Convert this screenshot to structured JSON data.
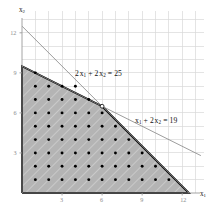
{
  "chart_data": {
    "type": "scatter",
    "title": "",
    "xlabel": "x₁",
    "ylabel": "x₂",
    "xlim": [
      0,
      13.6
    ],
    "ylim": [
      0,
      13.6
    ],
    "grid": true,
    "legend": "none",
    "xticks": [
      3,
      6,
      9,
      12
    ],
    "yticks": [
      3,
      6,
      9,
      12
    ],
    "xtick_labels": [
      "3",
      "6",
      "9",
      "12"
    ],
    "ytick_labels": [
      "3",
      "6",
      "9",
      "12"
    ],
    "annotations": [
      {
        "name": "constraint-label-2x1-2x2",
        "text_plain": "2 x₁ + 2 x₂ = 25",
        "x": 4.2,
        "y": 8.4
      },
      {
        "name": "constraint-label-x1-2x2",
        "text_plain": "x₁ + 2 x₂ = 19",
        "x": 8.6,
        "y": 5.6
      }
    ],
    "series": [
      {
        "name": "2 x1 + 2 x2 = 25",
        "type": "line",
        "color": "#8a8a8a",
        "equation": "2 x1 + 2 x2 = 25",
        "points": [
          [
            0,
            12.5
          ],
          [
            12.5,
            0
          ]
        ]
      },
      {
        "name": "x1 + 2 x2 = 19",
        "type": "line",
        "color": "#8a8a8a",
        "equation": "x1 + 2 x2 = 19",
        "points": [
          [
            0,
            9.5
          ],
          [
            13.4,
            2.8
          ]
        ]
      },
      {
        "name": "feasible region",
        "type": "area",
        "fill": "#b3b3b3",
        "edge": "#000000",
        "vertices": [
          [
            0,
            0
          ],
          [
            0,
            9.5
          ],
          [
            6,
            6.5
          ],
          [
            12.5,
            0
          ]
        ]
      },
      {
        "name": "integer lattice points",
        "type": "scatter",
        "color": "#000000",
        "points": [
          [
            1,
            1
          ],
          [
            2,
            1
          ],
          [
            3,
            1
          ],
          [
            4,
            1
          ],
          [
            5,
            1
          ],
          [
            6,
            1
          ],
          [
            7,
            1
          ],
          [
            8,
            1
          ],
          [
            9,
            1
          ],
          [
            10,
            1
          ],
          [
            11,
            1
          ],
          [
            1,
            2
          ],
          [
            2,
            2
          ],
          [
            3,
            2
          ],
          [
            4,
            2
          ],
          [
            5,
            2
          ],
          [
            6,
            2
          ],
          [
            7,
            2
          ],
          [
            8,
            2
          ],
          [
            9,
            2
          ],
          [
            10,
            2
          ],
          [
            1,
            3
          ],
          [
            2,
            3
          ],
          [
            3,
            3
          ],
          [
            4,
            3
          ],
          [
            5,
            3
          ],
          [
            6,
            3
          ],
          [
            7,
            3
          ],
          [
            8,
            3
          ],
          [
            9,
            3
          ],
          [
            1,
            4
          ],
          [
            2,
            4
          ],
          [
            3,
            4
          ],
          [
            4,
            4
          ],
          [
            5,
            4
          ],
          [
            6,
            4
          ],
          [
            7,
            4
          ],
          [
            8,
            4
          ],
          [
            1,
            5
          ],
          [
            2,
            5
          ],
          [
            3,
            5
          ],
          [
            4,
            5
          ],
          [
            5,
            5
          ],
          [
            6,
            5
          ],
          [
            7,
            5
          ],
          [
            1,
            6
          ],
          [
            2,
            6
          ],
          [
            3,
            6
          ],
          [
            4,
            6
          ],
          [
            5,
            6
          ],
          [
            6,
            6
          ],
          [
            1,
            7
          ],
          [
            2,
            7
          ],
          [
            3,
            7
          ],
          [
            4,
            7
          ],
          [
            5,
            7
          ],
          [
            1,
            8
          ],
          [
            2,
            8
          ],
          [
            3,
            8
          ],
          [
            4,
            8
          ],
          [
            1,
            9
          ]
        ]
      },
      {
        "name": "vertex marker",
        "type": "scatter",
        "marker": "open-circle",
        "points": [
          [
            6,
            6.5
          ]
        ]
      }
    ]
  },
  "axes": {
    "x_label": "x₁",
    "y_label": "x₂",
    "x_tick_labels": [
      "3",
      "6",
      "9",
      "12"
    ],
    "y_tick_labels": [
      "3",
      "6",
      "9",
      "12"
    ]
  },
  "labels": {
    "constraint_a": "2 x₁ + 2 x₂ = 25",
    "constraint_b": "x₁ + 2 x₂ = 19"
  },
  "colors": {
    "region_fill": "#b3b3b3",
    "region_edge": "#000000",
    "line": "#8a8a8a",
    "grid": "#d8d8d8",
    "tick_text": "#8d8d8d",
    "background": "#ffffff"
  }
}
